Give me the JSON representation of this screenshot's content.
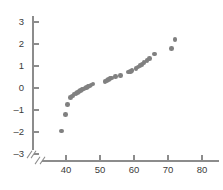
{
  "chart_data": {
    "type": "scatter",
    "title": "",
    "subtitle": "",
    "xlabel": "",
    "ylabel": "",
    "xlim": [
      36.5,
      82
    ],
    "ylim": [
      -3.6,
      3.6
    ],
    "xticks": [
      40,
      50,
      60,
      70,
      80
    ],
    "yticks": [
      3,
      2,
      1,
      0,
      -1,
      -2,
      -3
    ],
    "ytick_labels": [
      "3",
      "2",
      "1",
      "0",
      "–1",
      "–2",
      "–3"
    ],
    "xtick_labels": [
      "40",
      "50",
      "60",
      "70",
      "80"
    ],
    "grid": false,
    "legend": null,
    "axis_break_x": true,
    "axis_break_y": true,
    "marker": "circle",
    "marker_color": "#808080",
    "axis_color": "#8c8c8c",
    "label_color": "#3b3b3b",
    "points": [
      [
        38.6,
        -1.95
      ],
      [
        39.8,
        -1.2
      ],
      [
        40.5,
        -0.75
      ],
      [
        41.3,
        -0.44
      ],
      [
        41.9,
        -0.36
      ],
      [
        42.4,
        -0.28
      ],
      [
        42.9,
        -0.24
      ],
      [
        43.3,
        -0.2
      ],
      [
        43.8,
        -0.16
      ],
      [
        44.2,
        -0.12
      ],
      [
        44.7,
        -0.08
      ],
      [
        45.1,
        -0.04
      ],
      [
        45.6,
        0.0
      ],
      [
        46.0,
        0.03
      ],
      [
        46.5,
        0.07
      ],
      [
        46.9,
        0.1
      ],
      [
        47.4,
        0.14
      ],
      [
        47.9,
        0.18
      ],
      [
        51.5,
        0.3
      ],
      [
        52.0,
        0.34
      ],
      [
        52.5,
        0.38
      ],
      [
        53.0,
        0.42
      ],
      [
        53.4,
        0.45
      ],
      [
        54.6,
        0.52
      ],
      [
        56.0,
        0.56
      ],
      [
        58.3,
        0.72
      ],
      [
        58.9,
        0.76
      ],
      [
        59.4,
        0.8
      ],
      [
        60.6,
        0.88
      ],
      [
        61.2,
        0.96
      ],
      [
        61.8,
        1.02
      ],
      [
        62.4,
        1.08
      ],
      [
        63.0,
        1.16
      ],
      [
        63.8,
        1.24
      ],
      [
        64.6,
        1.34
      ],
      [
        66.0,
        1.55
      ],
      [
        71.0,
        1.8
      ],
      [
        72.0,
        2.2
      ]
    ]
  }
}
